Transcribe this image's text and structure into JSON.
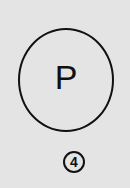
{
  "symbol": {
    "letter": "P",
    "name": "dry-clean-P"
  },
  "label": {
    "number": "4"
  }
}
